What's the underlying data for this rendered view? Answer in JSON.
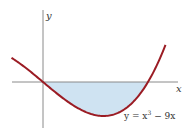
{
  "figure": {
    "x_axis_label": "x",
    "y_axis_label": "y",
    "equation_label_prefix": "y = x",
    "equation_label_exp": "3",
    "equation_label_suffix": " − 9x",
    "colors": {
      "curve": "#9b1c24",
      "axes": "#8a8a8a",
      "shaded_region": "#cfe3f2"
    }
  },
  "chart_data": {
    "type": "line",
    "title": "",
    "function": "y = x^3 - 9x",
    "xlabel": "x",
    "ylabel": "y",
    "x_range": [
      -0.9,
      3.5
    ],
    "shaded_region": {
      "from_x": 0,
      "to_x": 3,
      "description": "area between curve and x-axis, below axis"
    },
    "roots_shown": [
      0,
      3
    ],
    "local_min": {
      "x": 1.732,
      "y": -10.39
    },
    "grid": false,
    "ticks": "none"
  }
}
